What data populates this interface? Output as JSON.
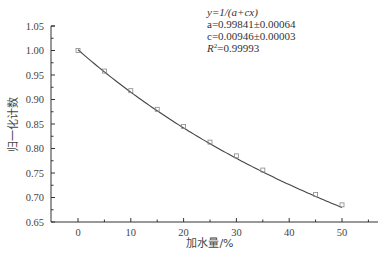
{
  "chart_data": {
    "type": "scatter",
    "title": "",
    "xlabel": "加水量/%",
    "ylabel": "归一化计数",
    "xlim": [
      -5,
      55
    ],
    "ylim": [
      0.65,
      1.05
    ],
    "x_ticks": [
      0,
      10,
      20,
      30,
      40,
      50
    ],
    "y_ticks": [
      "0.65",
      "0.70",
      "0.75",
      "0.80",
      "0.85",
      "0.90",
      "0.95",
      "1.00",
      "1.05"
    ],
    "grid": false,
    "legend": null,
    "series": [
      {
        "name": "measured",
        "marker": "square",
        "x": [
          0,
          5,
          10,
          15,
          20,
          25,
          30,
          35,
          45,
          50
        ],
        "y": [
          1.0,
          0.958,
          0.918,
          0.88,
          0.845,
          0.813,
          0.785,
          0.756,
          0.706,
          0.685
        ]
      },
      {
        "name": "fit",
        "type": "line",
        "equation": "y=1/(a+cx)",
        "a": 0.99841,
        "c": 0.00946
      }
    ],
    "annotations": [
      "y=1/(a+cx)",
      "a=0.99841±0.00064",
      "c=0.00946±0.00003",
      "R²=0.99993"
    ]
  },
  "annotation": {
    "line1": "y=1/(a+cx)",
    "line2": "a=0.99841±0.00064",
    "line3": "c=0.00946±0.00003",
    "line4_prefix": "R",
    "line4_sup": "2",
    "line4_rest": "=0.99993"
  }
}
